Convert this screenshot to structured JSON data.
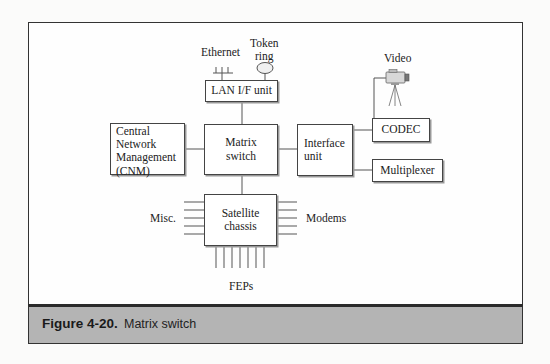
{
  "diagram": {
    "nodes": {
      "lan_if_unit": "LAN I/F unit",
      "cnm": [
        "Central",
        "Network",
        "Management",
        "(CNM)"
      ],
      "matrix_switch": [
        "Matrix",
        "switch"
      ],
      "interface_unit": [
        "Interface",
        "unit"
      ],
      "codec": "CODEC",
      "multiplexer": "Multiplexer",
      "satellite_chassis": [
        "Satellite",
        "chassis"
      ]
    },
    "labels": {
      "ethernet": "Ethernet",
      "token_ring": [
        "Token",
        "ring"
      ],
      "video": "Video",
      "misc": "Misc.",
      "modems": "Modems",
      "feps": "FEPs"
    },
    "icons": {
      "ethernet": "ethernet-bus-icon",
      "token_ring": "token-ring-icon",
      "video": "video-camera-icon"
    },
    "edges": [
      [
        "Ethernet",
        "LAN I/F unit"
      ],
      [
        "Token ring",
        "LAN I/F unit"
      ],
      [
        "LAN I/F unit",
        "Matrix switch"
      ],
      [
        "Central Network Management (CNM)",
        "Matrix switch"
      ],
      [
        "Matrix switch",
        "Interface unit"
      ],
      [
        "Interface unit",
        "CODEC"
      ],
      [
        "Interface unit",
        "Multiplexer"
      ],
      [
        "CODEC",
        "Video"
      ],
      [
        "Matrix switch",
        "Satellite chassis"
      ],
      [
        "Misc.",
        "Satellite chassis"
      ],
      [
        "Modems",
        "Satellite chassis"
      ],
      [
        "FEPs",
        "Satellite chassis"
      ]
    ],
    "colors": {
      "caption_band": "#b4b4b4",
      "frame_border": "#333333"
    }
  },
  "caption": {
    "figure_number": "Figure 4-20.",
    "title": "Matrix switch"
  }
}
